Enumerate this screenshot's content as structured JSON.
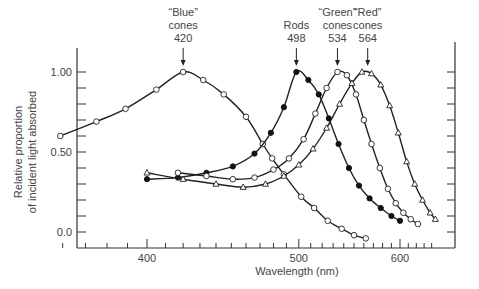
{
  "chart_data": {
    "type": "line",
    "title": "",
    "xlabel": "Wavelength (nm)",
    "ylabel": "Relative proportion of incident light absorbed",
    "x_ticks": [
      "400",
      "500",
      "600"
    ],
    "y_ticks": [
      "0.0",
      "0.50",
      "1.00"
    ],
    "xlim": [
      355,
      650
    ],
    "ylim": [
      -0.08,
      1.12
    ],
    "grid": false,
    "legend": "annotations above peaks",
    "annotations": [
      {
        "lines": [
          "“Blue”",
          "cones",
          "420"
        ],
        "x": 420
      },
      {
        "lines": [
          "Rods",
          "498"
        ],
        "x": 498
      },
      {
        "lines": [
          "“Green”",
          "cones",
          "534"
        ],
        "x": 534
      },
      {
        "lines": [
          "“Red”",
          "cones",
          "564"
        ],
        "x": 564
      }
    ],
    "series": [
      {
        "name": "Blue cones (420)",
        "marker": "open-circle",
        "x": [
          359,
          375,
          389,
          405,
          420,
          432,
          445,
          460,
          472,
          479,
          488,
          502,
          513,
          525,
          538,
          550,
          562
        ],
        "y": [
          0.6,
          0.69,
          0.77,
          0.89,
          1.0,
          0.95,
          0.86,
          0.72,
          0.55,
          0.46,
          0.36,
          0.22,
          0.15,
          0.07,
          0.02,
          -0.02,
          -0.04
        ]
      },
      {
        "name": "Rods (498)",
        "marker": "filled-circle",
        "x": [
          400,
          417,
          434,
          451,
          466,
          478,
          488,
          498,
          508,
          517,
          526,
          535,
          545,
          555,
          566,
          578,
          590,
          600
        ],
        "y": [
          0.33,
          0.34,
          0.37,
          0.41,
          0.49,
          0.62,
          0.78,
          1.0,
          0.95,
          0.86,
          0.71,
          0.55,
          0.4,
          0.29,
          0.21,
          0.15,
          0.1,
          0.07
        ],
        "peak_marker_x": 498
      },
      {
        "name": "Green cones (534)",
        "marker": "open-circle",
        "x": [
          417,
          434,
          451,
          466,
          480,
          492,
          504,
          514,
          524,
          534,
          543,
          552,
          560,
          568,
          577,
          586,
          595,
          604,
          613,
          622
        ],
        "y": [
          0.37,
          0.35,
          0.33,
          0.34,
          0.39,
          0.46,
          0.58,
          0.74,
          0.9,
          1.0,
          0.98,
          0.86,
          0.7,
          0.55,
          0.4,
          0.27,
          0.18,
          0.12,
          0.08,
          0.05
        ]
      },
      {
        "name": "Red cones (564)",
        "marker": "open-triangle",
        "x": [
          400,
          420,
          440,
          458,
          474,
          488,
          500,
          512,
          524,
          536,
          548,
          558,
          568,
          578,
          588,
          598,
          608,
          618,
          628,
          638,
          645
        ],
        "y": [
          0.37,
          0.33,
          0.3,
          0.28,
          0.3,
          0.35,
          0.42,
          0.52,
          0.65,
          0.8,
          0.93,
          1.0,
          0.99,
          0.92,
          0.79,
          0.62,
          0.44,
          0.3,
          0.2,
          0.12,
          0.08
        ]
      }
    ]
  },
  "labels": {
    "ylabel_line1": "Relative proportion",
    "ylabel_line2": "of incident light absorbed",
    "xlabel": "Wavelength (nm)"
  }
}
